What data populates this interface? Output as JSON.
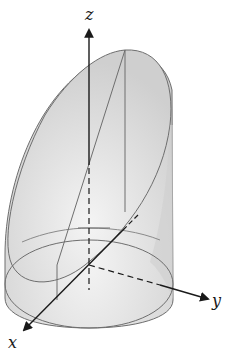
{
  "figure": {
    "axes": {
      "x_label": "x",
      "y_label": "y",
      "z_label": "z"
    },
    "colors": {
      "surface_fill": "#d9d9d9",
      "surface_light": "#f2f2f2",
      "edge_stroke": "#6e6e6e",
      "axis_stroke": "#1a1a1a"
    }
  }
}
